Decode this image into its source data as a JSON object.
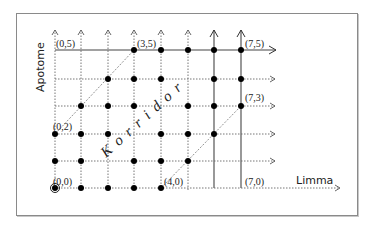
{
  "diagram": {
    "x_axis_label": "Limma",
    "y_axis_label": "Apotome",
    "region_label": "Korridor",
    "grid": {
      "columns": 8,
      "rows": 6,
      "col_x": [
        55,
        81,
        108,
        134,
        161,
        188,
        214,
        241
      ],
      "row_y": [
        188,
        161,
        134,
        106,
        79,
        50
      ]
    },
    "points": [
      {
        "row": 0,
        "cols": [
          0,
          1,
          2,
          3,
          4
        ]
      },
      {
        "row": 1,
        "cols": [
          0,
          1,
          3,
          4,
          5
        ]
      },
      {
        "row": 2,
        "cols": [
          0,
          1,
          2,
          4,
          5,
          6
        ]
      },
      {
        "row": 3,
        "cols": [
          1,
          2,
          3,
          5,
          6,
          7
        ]
      },
      {
        "row": 4,
        "cols": [
          2,
          3,
          4,
          6,
          7
        ]
      },
      {
        "row": 5,
        "cols": [
          3,
          4,
          5,
          6,
          7
        ]
      }
    ],
    "labels": [
      {
        "id": "p00",
        "text": "(0,0)"
      },
      {
        "id": "p02",
        "text": "(0,2)"
      },
      {
        "id": "p05",
        "text": "(0,5)"
      },
      {
        "id": "p35",
        "text": "(3,5)"
      },
      {
        "id": "p40",
        "text": "(4,0)"
      },
      {
        "id": "p70",
        "text": "(7,0)"
      },
      {
        "id": "p73",
        "text": "(7,3)"
      },
      {
        "id": "p75",
        "text": "(7,5)"
      }
    ],
    "colors": {
      "line": "#333333",
      "dotted": "#555555",
      "point": "#000000"
    }
  }
}
